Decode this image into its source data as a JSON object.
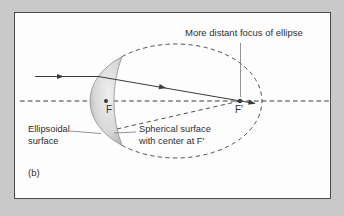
{
  "figure": {
    "panel_label": "(b)",
    "labels": {
      "distant_focus": "More distant focus of ellipse",
      "ellipsoidal_line1": "Ellipsoidal",
      "ellipsoidal_line2": "surface",
      "spherical_line1": "Spherical surface",
      "spherical_line2": "with center at F′",
      "focus_near": "F",
      "focus_far": "F′"
    },
    "colors": {
      "outer_background": "#c9c9c9",
      "frame_border": "#4a4a4a",
      "panel_background": "#fdfdfd",
      "line_color": "#3a3a3a",
      "leader_color": "#777777",
      "lens_edge": "#8f8f8f",
      "lens_fill_light": "#efefef",
      "lens_fill_mid": "#d8d8d8",
      "lens_fill_dark": "#a2a2a2",
      "text_color": "#2e2e2e"
    }
  }
}
